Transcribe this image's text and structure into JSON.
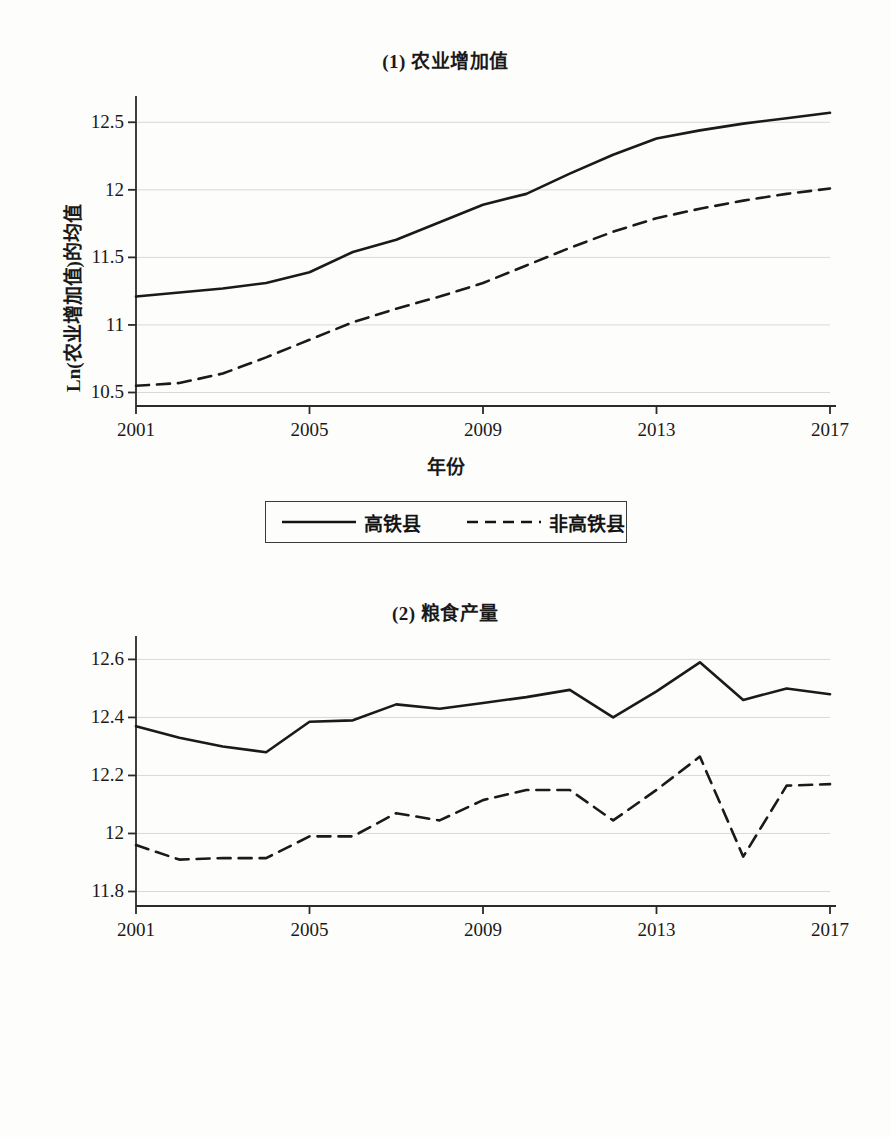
{
  "figure": {
    "panels": [
      {
        "title": "(1) 农业增加值",
        "ylabel": "Ln(农业增加值)的均值",
        "xlabel": "年份"
      },
      {
        "title": "(2) 粮食产量",
        "ylabel": "Ln(粮食产量)的均值",
        "xlabel": "年份"
      }
    ],
    "legend": {
      "solid_label": "高铁县",
      "dashed_label": "非高铁县"
    },
    "colors": {
      "line": "#1a1a1a",
      "grid": "#d9d9d9",
      "axis": "#2b2b2b",
      "background": "#fdfdfc"
    }
  },
  "chart_data": [
    {
      "type": "line",
      "title": "(1) 农业增加值",
      "xlabel": "年份",
      "ylabel": "Ln(农业增加值)的均值",
      "x": [
        2001,
        2002,
        2003,
        2004,
        2005,
        2006,
        2007,
        2008,
        2009,
        2010,
        2011,
        2012,
        2013,
        2014,
        2015,
        2016,
        2017
      ],
      "xticks": [
        2001,
        2005,
        2009,
        2013,
        2017
      ],
      "yticks": [
        10.5,
        11,
        11.5,
        12,
        12.5
      ],
      "ylim": [
        10.4,
        12.65
      ],
      "xlim": [
        2001,
        2017
      ],
      "grid": true,
      "legend_position": "below-axes",
      "series": [
        {
          "name": "高铁县",
          "style": "solid",
          "values": [
            11.21,
            11.24,
            11.27,
            11.31,
            11.39,
            11.54,
            11.63,
            11.76,
            11.89,
            11.97,
            12.12,
            12.26,
            12.38,
            12.44,
            12.49,
            12.53,
            12.57
          ]
        },
        {
          "name": "非高铁县",
          "style": "dashed",
          "values": [
            10.55,
            10.57,
            10.64,
            10.76,
            10.89,
            11.02,
            11.12,
            11.21,
            11.31,
            11.44,
            11.57,
            11.69,
            11.79,
            11.86,
            11.92,
            11.97,
            12.01
          ]
        }
      ]
    },
    {
      "type": "line",
      "title": "(2) 粮食产量",
      "xlabel": "年份",
      "ylabel": "Ln(粮食产量)的均值",
      "x": [
        2001,
        2002,
        2003,
        2004,
        2005,
        2006,
        2007,
        2008,
        2009,
        2010,
        2011,
        2012,
        2013,
        2014,
        2015,
        2016,
        2017
      ],
      "xticks": [
        2001,
        2005,
        2009,
        2013,
        2017
      ],
      "yticks": [
        11.8,
        12,
        12.2,
        12.4,
        12.6
      ],
      "ylim": [
        11.75,
        12.66
      ],
      "xlim": [
        2001,
        2017
      ],
      "grid": true,
      "legend_position": "below-axes",
      "series": [
        {
          "name": "高铁县",
          "style": "solid",
          "values": [
            12.37,
            12.33,
            12.3,
            12.28,
            12.385,
            12.39,
            12.445,
            12.43,
            12.45,
            12.47,
            12.495,
            12.4,
            12.49,
            12.59,
            12.46,
            12.5,
            12.48
          ]
        },
        {
          "name": "非高铁县",
          "style": "dashed",
          "values": [
            11.96,
            11.91,
            11.915,
            11.915,
            11.99,
            11.99,
            12.07,
            12.045,
            12.115,
            12.15,
            12.15,
            12.045,
            12.15,
            12.265,
            11.92,
            12.165,
            12.17
          ]
        }
      ]
    }
  ]
}
